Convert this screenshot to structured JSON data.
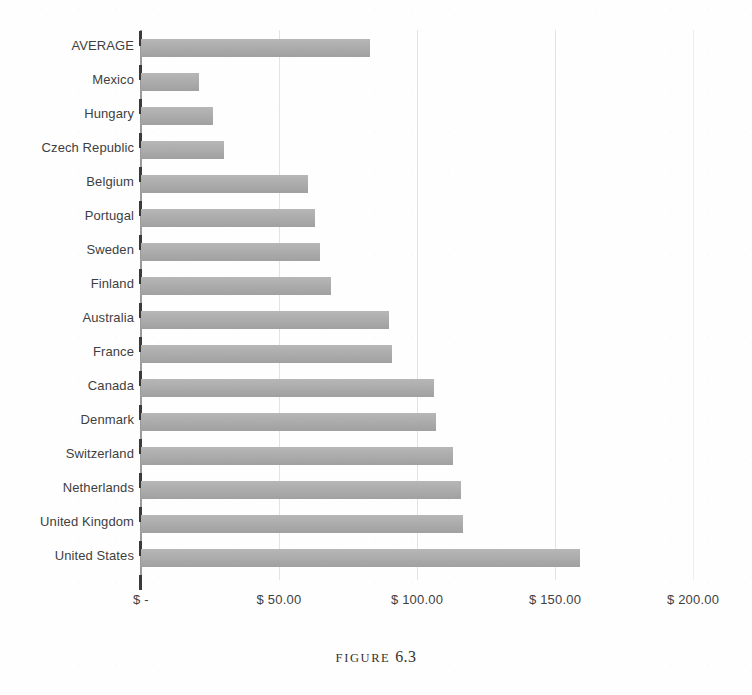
{
  "caption": {
    "word": "FIGURE",
    "number": "6.3",
    "full": "FIGURE 6.3"
  },
  "colors": {
    "bar": "#a9a9a9",
    "gridline": "#e3e3e3",
    "axis": "#3a3a3a",
    "label_text": "#3f3f3f",
    "page_background": "#fefefe"
  },
  "chart_data": {
    "type": "bar",
    "orientation": "horizontal",
    "title": "",
    "xlabel": "",
    "ylabel": "",
    "xlim": [
      0,
      200
    ],
    "grid": true,
    "legend": false,
    "value_prefix": "$",
    "categories": [
      "AVERAGE",
      "Mexico",
      "Hungary",
      "Czech Republic",
      "Belgium",
      "Portugal",
      "Sweden",
      "Finland",
      "Australia",
      "France",
      "Canada",
      "Denmark",
      "Switzerland",
      "Netherlands",
      "United Kingdom",
      "United States"
    ],
    "values": [
      83,
      21,
      26,
      30,
      60.5,
      63,
      65,
      69,
      90,
      91,
      106,
      107,
      113,
      116,
      116.5,
      159
    ],
    "ticks": [
      0,
      50,
      100,
      150,
      200
    ],
    "tick_labels": [
      "$ -",
      "$ 50.00",
      "$ 100.00",
      "$ 150.00",
      "$ 200.00"
    ]
  }
}
